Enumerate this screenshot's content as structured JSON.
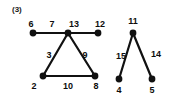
{
  "figure": {
    "caption": "(3)",
    "caption_x": 12,
    "caption_y": 6,
    "background_color": "#ffffff",
    "ink_color": "#111111",
    "node_fill": "#111111",
    "edge_color": "#111111",
    "node_radius": 3.4,
    "edge_width": 2.2
  },
  "graph": {
    "components": [
      {
        "name": "left-component",
        "vertices": [
          {
            "id": "v6",
            "label": "6",
            "x": 33,
            "y": 33,
            "label_x": 31,
            "label_y": 24
          },
          {
            "id": "v13",
            "label": "13",
            "x": 68,
            "y": 33,
            "label_x": 74,
            "label_y": 24
          },
          {
            "id": "v12",
            "label": "12",
            "x": 98,
            "y": 33,
            "label_x": 100,
            "label_y": 24
          },
          {
            "id": "v2",
            "label": "2",
            "x": 43,
            "y": 76,
            "label_x": 34,
            "label_y": 86
          },
          {
            "id": "v8",
            "label": "8",
            "x": 95,
            "y": 76,
            "label_x": 96,
            "label_y": 86
          }
        ],
        "edges": [
          {
            "from": "v6",
            "to": "v13",
            "label": "7",
            "label_x": 52,
            "label_y": 24
          },
          {
            "from": "v13",
            "to": "v12",
            "label": "",
            "label_x": 0,
            "label_y": 0
          },
          {
            "from": "v13",
            "to": "v2",
            "label": "3",
            "label_x": 49,
            "label_y": 55
          },
          {
            "from": "v13",
            "to": "v8",
            "label": "9",
            "label_x": 85,
            "label_y": 55
          },
          {
            "from": "v2",
            "to": "v8",
            "label": "10",
            "label_x": 68,
            "label_y": 86
          }
        ]
      },
      {
        "name": "right-component",
        "vertices": [
          {
            "id": "v11",
            "label": "11",
            "x": 133,
            "y": 33,
            "label_x": 133,
            "label_y": 21
          },
          {
            "id": "v4",
            "label": "4",
            "x": 119,
            "y": 79,
            "label_x": 119,
            "label_y": 90
          },
          {
            "id": "v5",
            "label": "5",
            "x": 152,
            "y": 79,
            "label_x": 152,
            "label_y": 90
          }
        ],
        "edges": [
          {
            "from": "v11",
            "to": "v4",
            "label": "15",
            "label_x": 121,
            "label_y": 56
          },
          {
            "from": "v11",
            "to": "v5",
            "label": "14",
            "label_x": 156,
            "label_y": 54
          }
        ]
      }
    ],
    "all_vertex_labels": [
      "6",
      "13",
      "12",
      "2",
      "8",
      "11",
      "4",
      "5"
    ],
    "all_edge_labels": [
      "7",
      "3",
      "9",
      "10",
      "15",
      "14"
    ]
  }
}
